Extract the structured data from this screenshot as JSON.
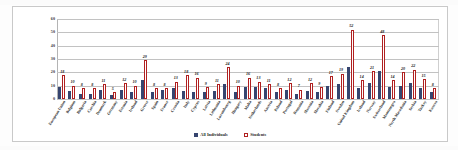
{
  "chart_data": {
    "type": "bar",
    "title": "",
    "xlabel": "",
    "ylabel": "",
    "ylim": [
      0,
      60
    ],
    "yticks": [
      0,
      10,
      20,
      30,
      40,
      50,
      60
    ],
    "grid": true,
    "legend_position": "bottom",
    "categories": [
      "European Union",
      "Belgium",
      "Bulgaria",
      "Czechia",
      "Denmark",
      "Germany",
      "Estonia",
      "Ireland",
      "Greece",
      "Spain",
      "France",
      "Croatia",
      "Italy",
      "Cyprus",
      "Latvia",
      "Lithuania",
      "Luxembourg",
      "Hungary",
      "Malta",
      "Netherlands",
      "Austria",
      "Poland",
      "Portugal",
      "Romania",
      "Slovenia",
      "Slovakia",
      "Finland",
      "Sweden",
      "United Kingdom",
      "Iceland",
      "Norway",
      "Switzerland",
      "Montenegro",
      "North Macedonia",
      "Serbia",
      "Turkey",
      "Kosovo"
    ],
    "series": [
      {
        "name": "All Individuals",
        "color": "#36456f",
        "values": [
          9,
          6,
          4,
          4,
          7,
          3,
          7,
          5,
          14,
          5,
          7,
          8,
          6,
          5,
          5,
          6,
          11,
          5,
          9,
          9,
          8,
          5,
          7,
          4,
          6,
          5,
          10,
          11,
          24,
          8,
          12,
          21,
          9,
          10,
          12,
          8,
          5
        ]
      },
      {
        "name": "Students",
        "color": "#b02020",
        "values": [
          18,
          10,
          8,
          8,
          11,
          5,
          12,
          10,
          29,
          8,
          8,
          13,
          18,
          16,
          9,
          11,
          24,
          10,
          16,
          13,
          11,
          8,
          12,
          7,
          12,
          9,
          17,
          19,
          52,
          14,
          21,
          48,
          14,
          20,
          22,
          15,
          8
        ],
        "labels": [
          "18",
          "10",
          "8",
          "8",
          "11",
          "5",
          "12",
          "10",
          "29",
          "8",
          "8",
          "13",
          "18",
          "16",
          "9",
          "11",
          "24",
          "10",
          "16",
          "13",
          "11",
          "8",
          "12",
          "7",
          "12",
          "9",
          "17",
          "19",
          "52",
          "14",
          "21",
          "48",
          "14",
          "20",
          "22",
          "15",
          "8"
        ]
      }
    ],
    "legend": [
      {
        "label": "All Individuals",
        "color": "#36456f"
      },
      {
        "label": "Students",
        "color": "#b02020"
      }
    ]
  }
}
